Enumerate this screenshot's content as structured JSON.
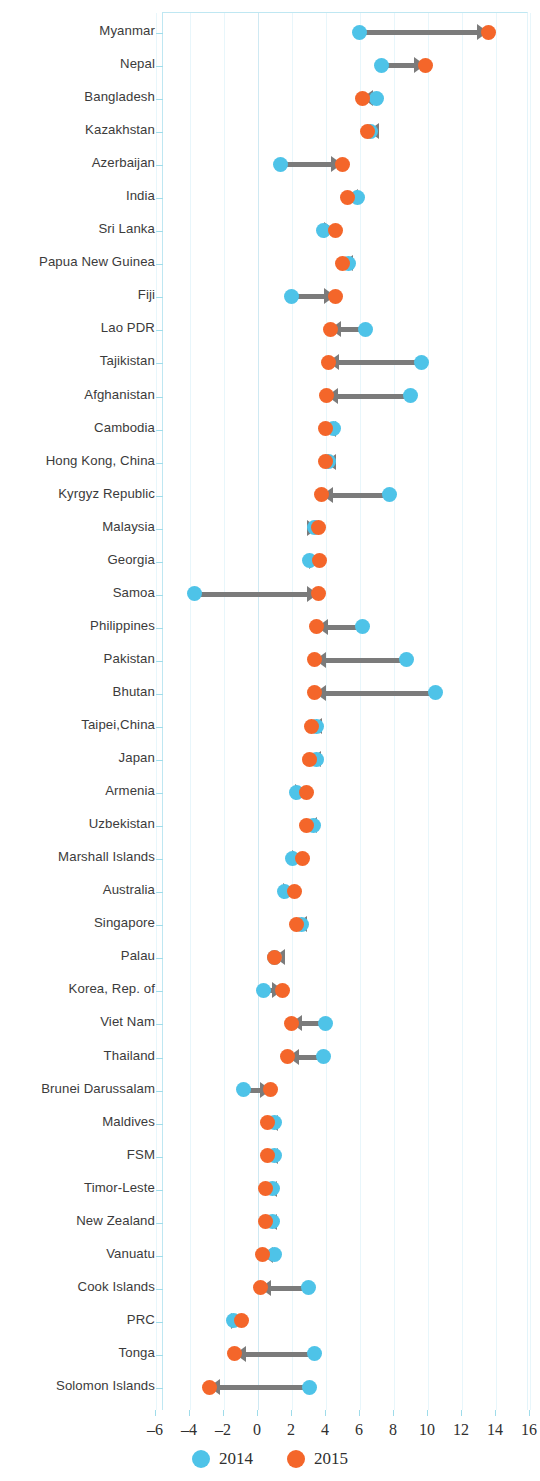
{
  "chart_data": {
    "type": "scatter",
    "subtype": "dumbbell-arrow",
    "title": "",
    "xlabel": "",
    "ylabel": "",
    "xlim": [
      -6,
      16
    ],
    "xticks": [
      -6,
      -4,
      -2,
      0,
      2,
      4,
      6,
      8,
      10,
      12,
      14,
      16
    ],
    "xtick_labels": [
      "–6",
      "–4",
      "–2",
      "0",
      "2",
      "4",
      "6",
      "8",
      "10",
      "12",
      "14",
      "16"
    ],
    "grid": true,
    "legend": {
      "position": "bottom",
      "entries": [
        {
          "name": "2014",
          "color": "#4ec3e8"
        },
        {
          "name": "2015",
          "color": "#f4662a"
        }
      ]
    },
    "series": [
      {
        "name": "2014",
        "color": "#4ec3e8"
      },
      {
        "name": "2015",
        "color": "#f4662a"
      }
    ],
    "categories": [
      "Myanmar",
      "Nepal",
      "Bangladesh",
      "Kazakhstan",
      "Azerbaijan",
      "India",
      "Sri Lanka",
      "Papua New Guinea",
      "Fiji",
      "Lao PDR",
      "Tajikistan",
      "Afghanistan",
      "Cambodia",
      "Hong Kong, China",
      "Kyrgyz Republic",
      "Malaysia",
      "Georgia",
      "Samoa",
      "Philippines",
      "Pakistan",
      "Bhutan",
      "Taipei,China",
      "Japan",
      "Armenia",
      "Uzbekistan",
      "Marshall Islands",
      "Australia",
      "Singapore",
      "Palau",
      "Korea, Rep. of",
      "Viet Nam",
      "Thailand",
      "Brunei Darussalam",
      "Maldives",
      "FSM",
      "Timor-Leste",
      "New Zealand",
      "Vanuatu",
      "Cook Islands",
      "PRC",
      "Tonga",
      "Solomon Islands"
    ],
    "rows": [
      {
        "label": "Myanmar",
        "v2014": 6.0,
        "v2015": 13.6
      },
      {
        "label": "Nepal",
        "v2014": 7.3,
        "v2015": 9.9
      },
      {
        "label": "Bangladesh",
        "v2014": 7.0,
        "v2015": 6.2
      },
      {
        "label": "Kazakhstan",
        "v2014": 6.7,
        "v2015": 6.5
      },
      {
        "label": "Azerbaijan",
        "v2014": 1.4,
        "v2015": 5.0
      },
      {
        "label": "India",
        "v2014": 5.9,
        "v2015": 5.3
      },
      {
        "label": "Sri Lanka",
        "v2014": 3.9,
        "v2015": 4.6
      },
      {
        "label": "Papua New Guinea",
        "v2014": 5.4,
        "v2015": 5.0
      },
      {
        "label": "Fiji",
        "v2014": 2.0,
        "v2015": 4.6
      },
      {
        "label": "Lao PDR",
        "v2014": 6.4,
        "v2015": 4.3
      },
      {
        "label": "Tajikistan",
        "v2014": 9.7,
        "v2015": 4.2
      },
      {
        "label": "Afghanistan",
        "v2014": 9.0,
        "v2015": 4.1
      },
      {
        "label": "Cambodia",
        "v2014": 4.5,
        "v2015": 4.0
      },
      {
        "label": "Hong Kong, China",
        "v2014": 4.2,
        "v2015": 4.0
      },
      {
        "label": "Kyrgyz Republic",
        "v2014": 7.8,
        "v2015": 3.8
      },
      {
        "label": "Malaysia",
        "v2014": 3.4,
        "v2015": 3.6
      },
      {
        "label": "Georgia",
        "v2014": 3.1,
        "v2015": 3.7
      },
      {
        "label": "Samoa",
        "v2014": -3.7,
        "v2015": 3.6
      },
      {
        "label": "Philippines",
        "v2014": 6.2,
        "v2015": 3.5
      },
      {
        "label": "Pakistan",
        "v2014": 8.8,
        "v2015": 3.4
      },
      {
        "label": "Bhutan",
        "v2014": 10.5,
        "v2015": 3.4
      },
      {
        "label": "Taipei,China",
        "v2014": 3.5,
        "v2015": 3.2
      },
      {
        "label": "Japan",
        "v2014": 3.5,
        "v2015": 3.1
      },
      {
        "label": "Armenia",
        "v2014": 2.3,
        "v2015": 2.9
      },
      {
        "label": "Uzbekistan",
        "v2014": 3.3,
        "v2015": 2.9
      },
      {
        "label": "Marshall Islands",
        "v2014": 2.1,
        "v2015": 2.7
      },
      {
        "label": "Australia",
        "v2014": 1.6,
        "v2015": 2.2
      },
      {
        "label": "Singapore",
        "v2014": 2.6,
        "v2015": 2.3
      },
      {
        "label": "Palau",
        "v2014": 1.0,
        "v2015": 1.0
      },
      {
        "label": "Korea, Rep. of",
        "v2014": 0.4,
        "v2015": 1.5
      },
      {
        "label": "Viet Nam",
        "v2014": 4.0,
        "v2015": 2.0
      },
      {
        "label": "Thailand",
        "v2014": 3.9,
        "v2015": 1.8
      },
      {
        "label": "Brunei Darussalam",
        "v2014": -0.8,
        "v2015": 0.8
      },
      {
        "label": "Maldives",
        "v2014": 1.0,
        "v2015": 0.6
      },
      {
        "label": "FSM",
        "v2014": 1.0,
        "v2015": 0.6
      },
      {
        "label": "Timor-Leste",
        "v2014": 0.9,
        "v2015": 0.5
      },
      {
        "label": "New Zealand",
        "v2014": 0.9,
        "v2015": 0.5
      },
      {
        "label": "Vanuatu",
        "v2014": 1.0,
        "v2015": 0.3
      },
      {
        "label": "Cook Islands",
        "v2014": 3.0,
        "v2015": 0.2
      },
      {
        "label": "PRC",
        "v2014": -1.4,
        "v2015": -0.9
      },
      {
        "label": "Tonga",
        "v2014": 3.4,
        "v2015": -1.3
      },
      {
        "label": "Solomon Islands",
        "v2014": 3.1,
        "v2015": -2.8
      }
    ]
  },
  "legend": {
    "items": [
      {
        "label": "2014",
        "color": "#4ec3e8"
      },
      {
        "label": "2015",
        "color": "#f4662a"
      }
    ]
  },
  "colors": {
    "series_2014": "#4ec3e8",
    "series_2015": "#f4662a",
    "arrow": "#7b7b7b",
    "grid": "#e8f6fb",
    "axis": "#9fdcea",
    "text": "#3b3b3b"
  }
}
